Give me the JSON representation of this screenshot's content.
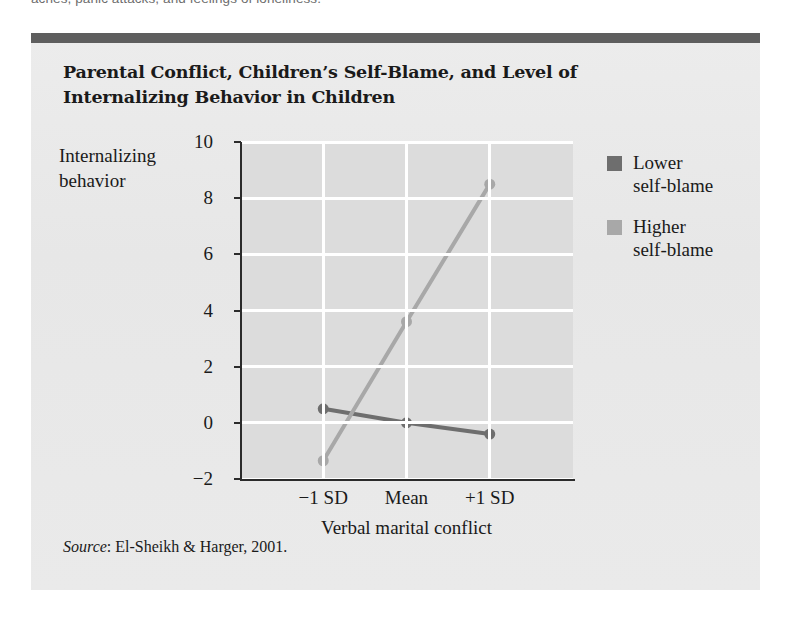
{
  "page": {
    "text_fragment": "aches, panic attacks, and feelings of loneliness."
  },
  "figure": {
    "title_line1": "Parental Conflict, Children’s Self-Blame, and Level of",
    "title_line2": "Internalizing Behavior in Children",
    "source_prefix": "Source",
    "source_text": ": El-Sheikh & Harger, 2001.",
    "header_bar_color": "#5e5e5e",
    "background_color": "#e9e9e9"
  },
  "chart_data": {
    "type": "line",
    "title": "Parental Conflict, Children’s Self-Blame, and Level of Internalizing Behavior in Children",
    "categories": [
      "−1 SD",
      "Mean",
      "+1 SD"
    ],
    "series": [
      {
        "name": "Lower self-blame",
        "values": [
          0.5,
          0.0,
          -0.4
        ],
        "color": "#6e6e6e"
      },
      {
        "name": "Higher self-blame",
        "values": [
          -1.35,
          3.6,
          8.5
        ],
        "color": "#a8a8a8"
      }
    ],
    "ylabel_line1": "Internalizing",
    "ylabel_line2": "behavior",
    "xlabel": "Verbal marital conflict",
    "ylim": [
      -2,
      10
    ],
    "yticks": [
      10,
      8,
      6,
      4,
      2,
      0,
      -2
    ],
    "ytick_labels": [
      "10",
      "8",
      "6",
      "4",
      "2",
      "0",
      "−2"
    ],
    "grid": true,
    "gridline_color": "#ffffff",
    "plot_background": "#dcdcdc",
    "legend_position": "right"
  }
}
